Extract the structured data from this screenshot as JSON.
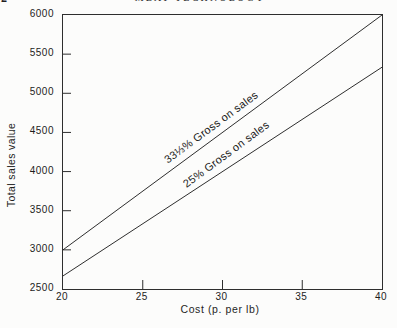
{
  "page_header": {
    "page_number": "2",
    "title": "MEAT TECHNOLOGY"
  },
  "chart_data": {
    "type": "line",
    "title": "",
    "xlabel": "Cost (p. per lb)",
    "ylabel": "Total sales value",
    "xlim": [
      20,
      40
    ],
    "ylim": [
      2500,
      6000
    ],
    "xticks": [
      20,
      25,
      30,
      35,
      40
    ],
    "yticks": [
      2500,
      3000,
      3500,
      4000,
      4500,
      5000,
      5500,
      6000
    ],
    "grid": false,
    "legend_position": "labels rotated along lines",
    "line_color": "#2e2e2e",
    "axis_color": "#2e2e2e",
    "series": [
      {
        "name": "33⅓% Gross on sales",
        "x": [
          20,
          40
        ],
        "values": [
          3000,
          6000
        ]
      },
      {
        "name": "25% Gross on sales",
        "x": [
          20,
          40
        ],
        "values": [
          2667,
          5333
        ]
      }
    ]
  }
}
